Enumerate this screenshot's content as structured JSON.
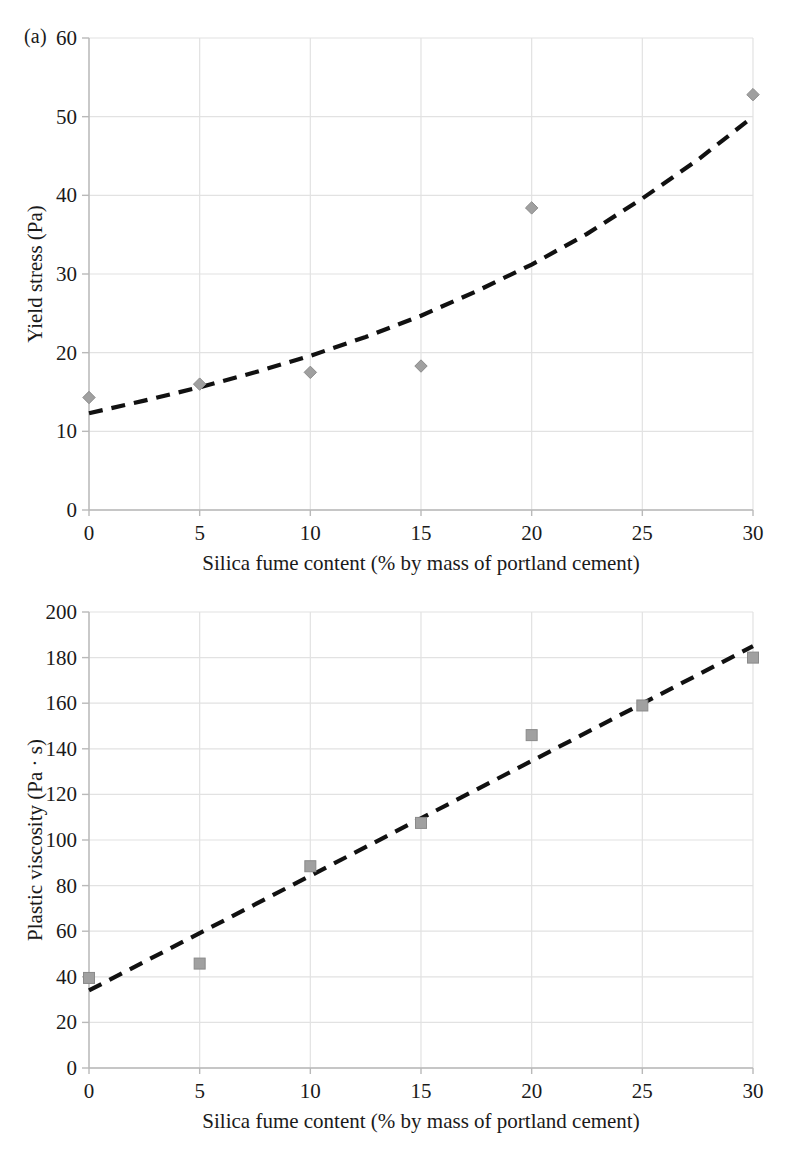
{
  "figure": {
    "panel_a_label": "(a)",
    "panel_b_label": "(b)",
    "shared_xlabel": "Silica fume content (% by mass of portland cement)",
    "marker_color": "#a0a0a0",
    "marker_stroke": "#8a8a8a",
    "trend_color": "#111111",
    "grid_color": "#e2e2e2",
    "axis_color": "#b9b9b9"
  },
  "chart_data": [
    {
      "type": "scatter",
      "title": "(a)",
      "xlabel": "Silica fume content (% by mass of portland cement)",
      "ylabel": "Yield stress (Pa)",
      "xlim": [
        0,
        30
      ],
      "ylim": [
        0,
        60
      ],
      "xticks": [
        0,
        5,
        10,
        15,
        20,
        25,
        30
      ],
      "yticks": [
        0,
        10,
        20,
        30,
        40,
        50,
        60
      ],
      "xtick_labels": [
        "0",
        "5",
        "10",
        "15",
        "20",
        "25",
        "30"
      ],
      "ytick_labels": [
        "0",
        "10",
        "20",
        "30",
        "40",
        "50",
        "60"
      ],
      "grid": true,
      "legend": "none",
      "marker": "diamond",
      "x": [
        0,
        5,
        10,
        15,
        20,
        30
      ],
      "y": [
        14.3,
        16.0,
        17.5,
        18.3,
        38.4,
        52.8
      ],
      "trendline": {
        "style": "dashed",
        "shape": "exponential",
        "x": [
          0,
          2.5,
          5,
          7.5,
          10,
          12.5,
          15,
          17.5,
          20,
          22.5,
          25,
          27.5,
          30
        ],
        "y": [
          12.3,
          13.9,
          15.6,
          17.5,
          19.6,
          22.0,
          24.7,
          27.8,
          31.2,
          35.1,
          39.6,
          44.5,
          50.0
        ]
      }
    },
    {
      "type": "scatter",
      "title": "(b)",
      "xlabel": "Silica fume content (% by mass of portland cement)",
      "ylabel": "Plastic viscosity (Pa · s)",
      "xlim": [
        0,
        30
      ],
      "ylim": [
        0,
        200
      ],
      "xticks": [
        0,
        5,
        10,
        15,
        20,
        25,
        30
      ],
      "yticks": [
        0,
        20,
        40,
        60,
        80,
        100,
        120,
        140,
        160,
        180,
        200
      ],
      "xtick_labels": [
        "0",
        "5",
        "10",
        "15",
        "20",
        "25",
        "30"
      ],
      "ytick_labels": [
        "0",
        "20",
        "40",
        "60",
        "80",
        "100",
        "120",
        "140",
        "160",
        "180",
        "200"
      ],
      "grid": true,
      "legend": "none",
      "marker": "square",
      "x": [
        0,
        5,
        10,
        15,
        20,
        25,
        30
      ],
      "y": [
        39.5,
        45.8,
        88.5,
        107.5,
        146.0,
        159.0,
        180.0
      ],
      "trendline": {
        "style": "dashed",
        "shape": "linear",
        "x": [
          0,
          30
        ],
        "y": [
          34.0,
          185.0
        ]
      }
    }
  ]
}
